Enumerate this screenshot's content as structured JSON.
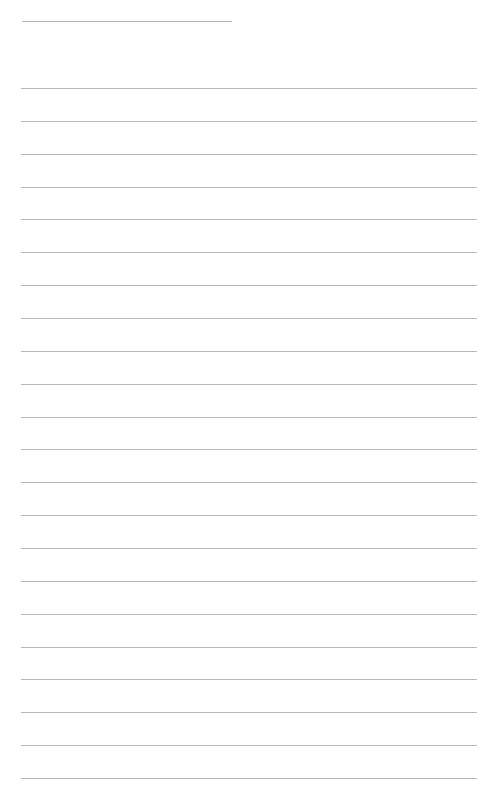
{
  "page": {
    "type": "blank lined paper",
    "background": "#ffffff",
    "line_color": "#b8b8b8",
    "header_line": {
      "y": 21,
      "x_start": 22,
      "x_end": 232
    },
    "ruled_lines": {
      "count": 22,
      "first_y": 88,
      "spacing": 32.86,
      "x_start": 21,
      "x_end": 477
    }
  }
}
